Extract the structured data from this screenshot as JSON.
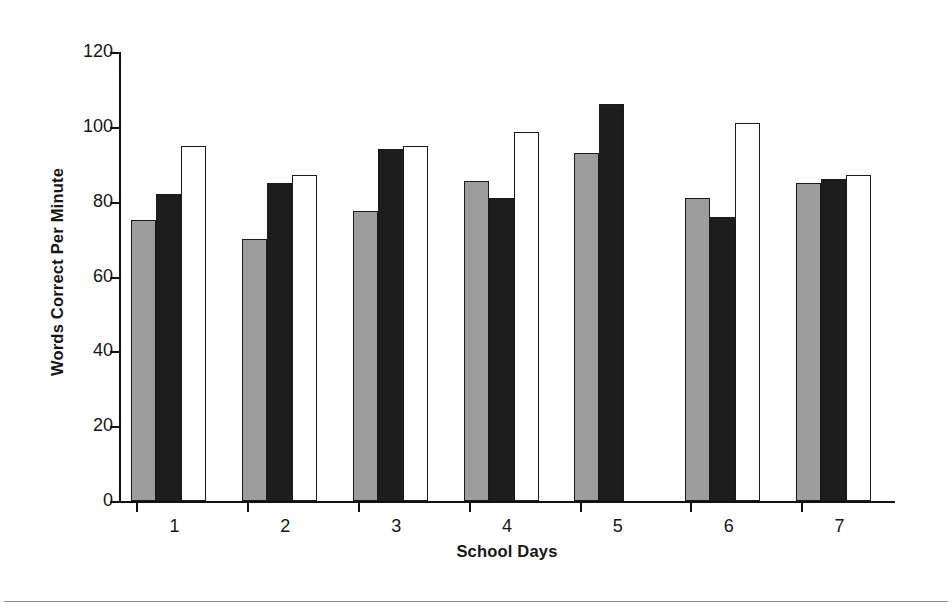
{
  "chart_data": {
    "type": "bar",
    "title": "",
    "xlabel": "School Days",
    "ylabel": "Words Correct Per Minute",
    "categories": [
      "1",
      "2",
      "3",
      "4",
      "5",
      "6",
      "7"
    ],
    "ylim": [
      0,
      120
    ],
    "yticks": [
      0,
      20,
      40,
      60,
      80,
      100,
      120
    ],
    "ytick_labels": [
      "0",
      "20",
      "40",
      "60",
      "80",
      "100",
      "120"
    ],
    "grid": false,
    "legend": "none",
    "series": [
      {
        "name": "gray-series",
        "color": "#9d9d9d",
        "values": [
          75,
          70,
          77.5,
          85.5,
          93,
          81,
          85
        ]
      },
      {
        "name": "black-series",
        "color": "#1d1d1d",
        "values": [
          82,
          85,
          94,
          81,
          106,
          76,
          86
        ]
      },
      {
        "name": "white-series",
        "color": "#ffffff",
        "values": [
          95,
          87,
          95,
          98.5,
          null,
          101,
          87
        ]
      }
    ]
  },
  "axis": {
    "line_color": "#111111"
  }
}
